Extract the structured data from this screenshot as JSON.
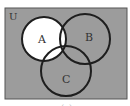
{
  "diagram": {
    "type": "venn",
    "universe_label": "U",
    "sets": [
      {
        "label": "A",
        "shaded": false
      },
      {
        "label": "B",
        "shaded": true
      },
      {
        "label": "C",
        "shaded": true
      }
    ],
    "unshaded_region": "A",
    "caption": "(a)"
  },
  "colors": {
    "background_shade": "#9c9c9c",
    "unshaded": "#ffffff",
    "outline": "#1e1e1e",
    "label": "#333333"
  }
}
